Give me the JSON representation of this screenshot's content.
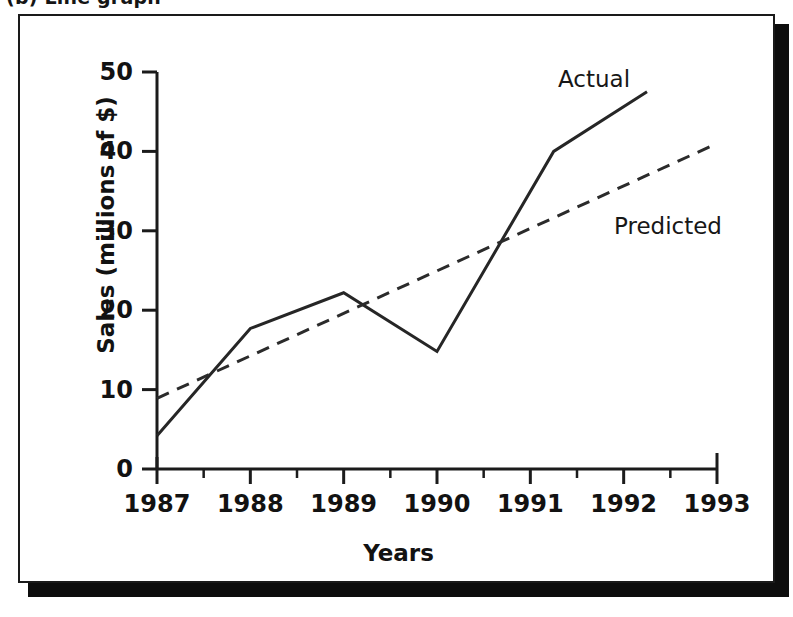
{
  "caption": {
    "text": "(b) Line graph"
  },
  "figure": {
    "frame_color": "#1a1a1a",
    "background": "#ffffff",
    "shadow_color": "#0d0d0d"
  },
  "axes": {
    "y_title": "Sales (millions of $)",
    "x_title": "Years",
    "y_ticks": [
      "0",
      "10",
      "20",
      "30",
      "40",
      "50"
    ],
    "x_ticks": [
      "1987",
      "1988",
      "1989",
      "1990",
      "1991",
      "1992",
      "1993"
    ]
  },
  "annotations": {
    "actual": "Actual",
    "predicted": "Predicted"
  },
  "chart_data": {
    "type": "line",
    "title": "",
    "xlabel": "Years",
    "ylabel": "Sales (millions of $)",
    "xlim": [
      1987,
      1993
    ],
    "ylim": [
      0,
      50
    ],
    "x_tick_values": [
      1987,
      1988,
      1989,
      1990,
      1991,
      1992,
      1993
    ],
    "y_tick_values": [
      0,
      10,
      20,
      30,
      40,
      50
    ],
    "minor_x_ticks": [
      1987.5,
      1988.5,
      1989.5,
      1990.5,
      1991.5,
      1992.5
    ],
    "grid": false,
    "legend": "inline-annotations",
    "series": [
      {
        "name": "Actual",
        "style": "solid",
        "color": "#262626",
        "line_width": 3,
        "x": [
          1987,
          1988,
          1989,
          1990,
          1991.25,
          1992.25
        ],
        "values": [
          4.2,
          17.7,
          22.2,
          14.8,
          40.0,
          47.5
        ],
        "annotation": "Actual",
        "annotation_at": [
          1991.1,
          51.5
        ]
      },
      {
        "name": "Predicted",
        "style": "dashed",
        "color": "#2b2b2b",
        "line_width": 3,
        "x": [
          1987,
          1993
        ],
        "values": [
          8.9,
          41.0
        ],
        "annotation": "Predicted",
        "annotation_at": [
          1991.8,
          32.0
        ]
      }
    ]
  }
}
